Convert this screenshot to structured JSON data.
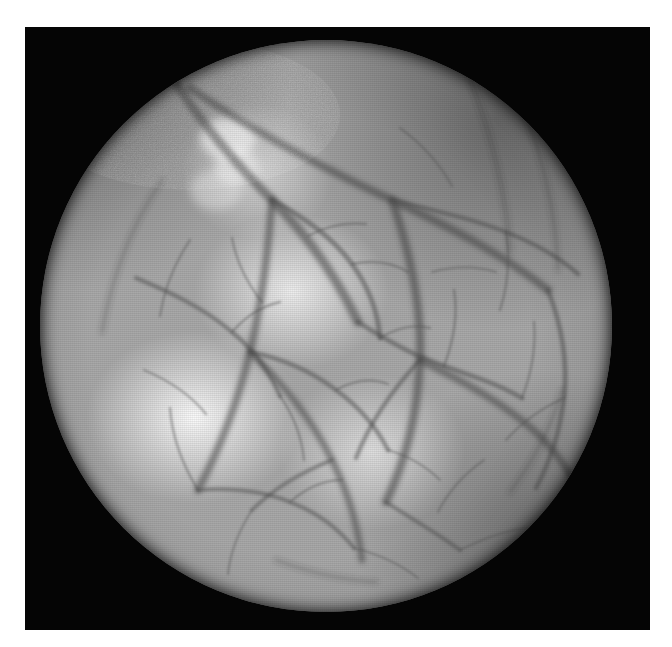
{
  "page": {
    "background_color": "#ffffff",
    "width": 672,
    "height": 647
  },
  "photograph": {
    "subject": "circular illuminated tissue field with branching blood vessels",
    "modality_appearance": "grayscale halftone-printed medical photograph",
    "frame": {
      "name": "black photographic mount",
      "color": "#050505",
      "left": 25,
      "top": 27,
      "width": 625,
      "height": 603
    },
    "field_of_view": {
      "name": "circular illuminated disc",
      "shape": "circle",
      "center_x": 326,
      "center_y": 326,
      "diameter": 572,
      "mean_tone": "#a9a9a9",
      "brightest_tone": "#f2f2f2",
      "darkest_rim_tone": "#1a1a1a"
    },
    "features": {
      "bright_highlight_regions": [
        {
          "name": "lower-left specular highlight",
          "center_x": 195,
          "center_y": 404
        },
        {
          "name": "central-left highlight",
          "center_x": 292,
          "center_y": 292
        },
        {
          "name": "lower-central highlight",
          "center_x": 372,
          "center_y": 451
        },
        {
          "name": "upper-left nodule highlight",
          "center_x": 257,
          "center_y": 173
        }
      ],
      "dark_gradient_regions": [
        {
          "name": "upper-right shadow falloff",
          "center_x": 497,
          "center_y": 122
        },
        {
          "name": "lower-right shadow falloff",
          "center_x": 543,
          "center_y": 542
        },
        {
          "name": "upper-left shadow falloff",
          "center_x": 86,
          "center_y": 87
        }
      ],
      "nodule": {
        "name": "bright rounded nodule",
        "center_x": 228,
        "center_y": 140,
        "radius_x": 26,
        "radius_y": 20
      },
      "vessel_count_major": 9,
      "vessel_count_minor": 22,
      "vessel_tone": "#6b6b6b"
    },
    "texture": {
      "halftone_raster": "horizontal scan lines with crossed dot screen",
      "grain": "film/print grain"
    }
  }
}
